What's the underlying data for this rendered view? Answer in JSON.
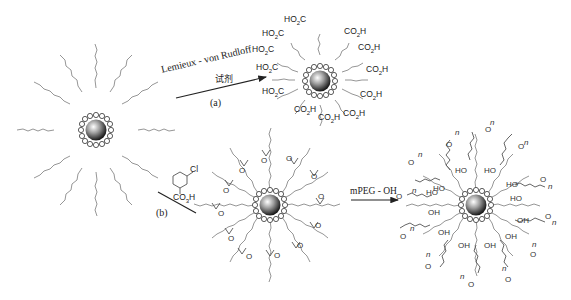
{
  "diagram": {
    "type": "reaction-scheme",
    "starting_material": {
      "label": "",
      "shell": "ligand shell",
      "chains": "unsaturated alkyl chains"
    },
    "route_a": {
      "reagent_line1": "Lemieux - von Rudloff",
      "reagent_line2": "试剂",
      "step_label": "(a)",
      "product_groups": [
        "HO2C",
        "HO2C",
        "HO2C",
        "HO2C",
        "HO2C",
        "CO2H",
        "CO2H",
        "CO2H",
        "CO2H",
        "CO2H",
        "CO2H",
        "CO2H"
      ]
    },
    "route_b": {
      "reagent_substituent": "Cl",
      "reagent_acid": "CO3H",
      "step_label": "(b)",
      "product_group": "O"
    },
    "route_c": {
      "reagent": "mPEG - OH",
      "product_groups": [
        "OH",
        "HO",
        "O",
        "n"
      ]
    }
  }
}
